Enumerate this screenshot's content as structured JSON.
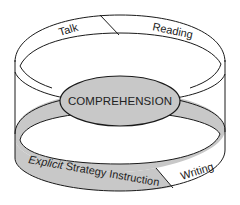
{
  "diagram": {
    "title": "",
    "colors": {
      "stroke": "#1a1a1a",
      "gray_fill": "#c8c8c8",
      "white_fill": "#ffffff",
      "text": "#222222"
    },
    "top_ring": {
      "segments": [
        {
          "label": "Talk",
          "fill": "white"
        },
        {
          "label": "Reading",
          "fill": "white"
        }
      ]
    },
    "center": {
      "label": "COMPREHENSION",
      "fill": "gray"
    },
    "bottom_ring": {
      "segments": [
        {
          "label_italic": "Explicit",
          "label_rest": " Strategy Instruction",
          "fill": "gray"
        },
        {
          "label": "Writing",
          "fill": "white"
        }
      ]
    }
  }
}
